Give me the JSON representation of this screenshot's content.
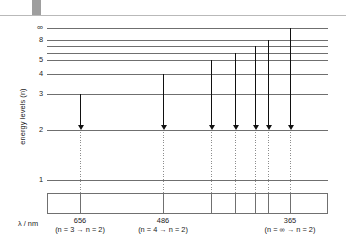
{
  "figure": {
    "y_axis_label": "energy levels (n)",
    "lambda_axis_label": "λ / nm"
  },
  "chart_data": {
    "type": "diagram",
    "title": "",
    "subtitle": "",
    "xlabel": "λ / nm",
    "ylabel": "energy levels (n)",
    "grid": false,
    "legend": "none",
    "energy_levels": [
      {
        "label": "∞",
        "n": "inf",
        "y": 12
      },
      {
        "label": "8",
        "n": 8,
        "y": 24
      },
      {
        "label": "",
        "n": 7,
        "y": 30
      },
      {
        "label": "",
        "n": 6,
        "y": 37
      },
      {
        "label": "5",
        "n": 5,
        "y": 44
      },
      {
        "label": "4",
        "n": 4,
        "y": 58
      },
      {
        "label": "3",
        "n": 3,
        "y": 78
      },
      {
        "label": "2",
        "n": 2,
        "y": 114
      },
      {
        "label": "1",
        "n": 1,
        "y": 164
      }
    ],
    "transitions": [
      {
        "from": 3,
        "to": 2,
        "x": 80,
        "from_y": 78,
        "wavelength_nm": 656
      },
      {
        "from": 4,
        "to": 2,
        "x": 163,
        "from_y": 58,
        "wavelength_nm": 486
      },
      {
        "from": 5,
        "to": 2,
        "x": 211,
        "from_y": 44,
        "wavelength_nm": 434
      },
      {
        "from": 6,
        "to": 2,
        "x": 235,
        "from_y": 37,
        "wavelength_nm": 410
      },
      {
        "from": 7,
        "to": 2,
        "x": 255,
        "from_y": 30,
        "wavelength_nm": 397
      },
      {
        "from": 8,
        "to": 2,
        "x": 268,
        "from_y": 24,
        "wavelength_nm": 389
      },
      {
        "from": "inf",
        "to": 2,
        "x": 290,
        "from_y": 12,
        "wavelength_nm": 365
      }
    ],
    "spectrum_box": {
      "x": 47,
      "y": 177,
      "width": 281,
      "height": 21
    },
    "wavelength_labels": [
      {
        "value": "656",
        "transition": "(n = 3 → n = 2)",
        "center_x": 80
      },
      {
        "value": "486",
        "transition": "(n = 4 → n = 2)",
        "center_x": 163
      },
      {
        "value": "365",
        "transition": "(n = ∞ → n = 2)",
        "center_x": 290
      }
    ],
    "colors": {
      "level_line": "#6f6f6f",
      "arrow": "#111111",
      "drop_line": "#8d8d8d",
      "box_border": "#707070",
      "text": "#1a1a1a",
      "top_tab": "#9e9e9e"
    }
  }
}
